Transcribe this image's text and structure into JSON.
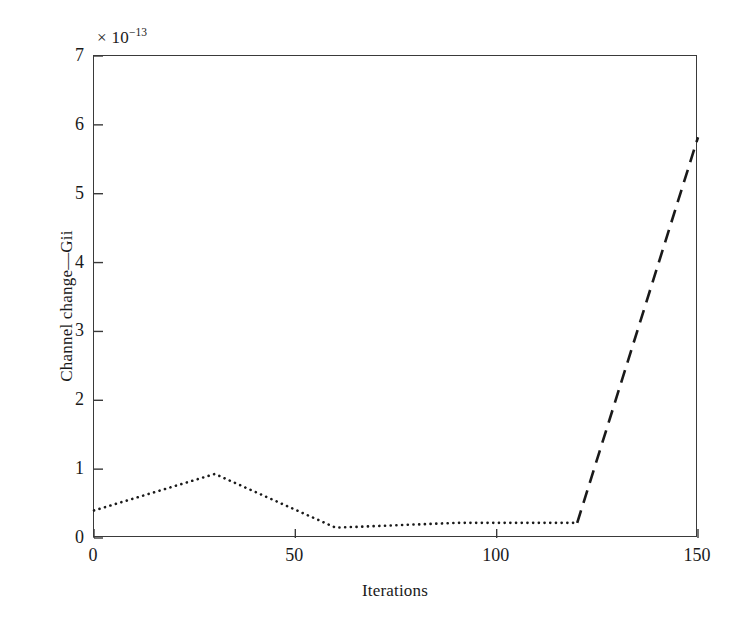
{
  "chart_data": {
    "type": "line",
    "title": "",
    "subtitle": "",
    "xlabel": "Iterations",
    "ylabel": "Channel change—Gii",
    "y_multiplier_prefix": "× 10",
    "y_multiplier_exponent": "−13",
    "y_multiplier_text": "× 10⁻¹³",
    "y_scale_factor": 1e-13,
    "xlim": [
      0,
      150
    ],
    "ylim": [
      0,
      7
    ],
    "xticks": [
      "0",
      "50",
      "100",
      "150"
    ],
    "xtick_values": [
      0,
      50,
      100,
      150
    ],
    "yticks": [
      "0",
      "1",
      "2",
      "3",
      "4",
      "5",
      "6",
      "7"
    ],
    "ytick_values": [
      0,
      1,
      2,
      3,
      4,
      5,
      6,
      7
    ],
    "grid": false,
    "legend": null,
    "frame": "box",
    "tick_direction": "in",
    "line_color": "#1a1a1a",
    "background_color": "#ffffff",
    "x": [
      0,
      30,
      60,
      90,
      120,
      150
    ],
    "values": [
      0.4,
      0.93,
      0.15,
      0.22,
      0.22,
      5.82
    ],
    "series": [
      {
        "name": "Channel change—Gii",
        "x": [
          0,
          30,
          60,
          90,
          120,
          150
        ],
        "values": [
          0.4,
          0.93,
          0.15,
          0.22,
          0.22,
          5.82
        ],
        "segments": [
          {
            "style": "dotted",
            "x": [
              0,
              30,
              60,
              90,
              120
            ],
            "values": [
              0.4,
              0.93,
              0.15,
              0.22,
              0.22
            ]
          },
          {
            "style": "dashed",
            "x": [
              120,
              150
            ],
            "values": [
              0.22,
              5.82
            ]
          }
        ]
      }
    ]
  }
}
